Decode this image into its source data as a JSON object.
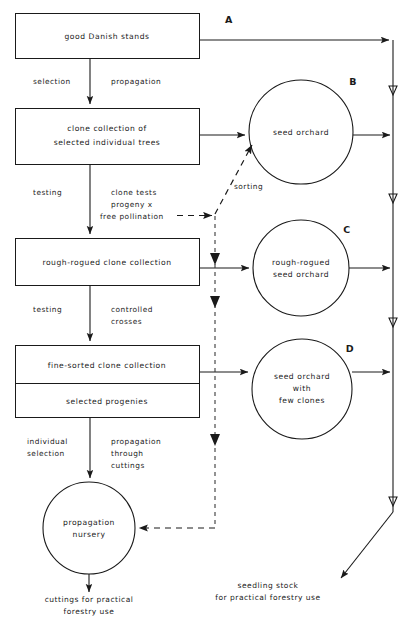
{
  "diagram": {
    "colors": {
      "stroke": "#1a1a1a",
      "background": "#ffffff",
      "dashed": "#3a3a3a"
    },
    "boxes": [
      {
        "id": "good-danish-stands",
        "lines": [
          "good Danish stands"
        ]
      },
      {
        "id": "clone-collection",
        "lines": [
          "clone collection of",
          "selected individual trees"
        ]
      },
      {
        "id": "rough-rogued-clone-collection",
        "lines": [
          "rough-rogued clone collection"
        ]
      },
      {
        "id": "fine-sorted-clone-collection",
        "lines": [
          "fine-sorted clone collection"
        ]
      },
      {
        "id": "selected-progenies",
        "lines": [
          "selected progenies"
        ]
      }
    ],
    "circles": [
      {
        "id": "seed-orchard",
        "letter": "B",
        "lines": [
          "seed orchard"
        ]
      },
      {
        "id": "rough-rogued-seed-orchard",
        "letter": "C",
        "lines": [
          "rough-rogued",
          "seed orchard"
        ]
      },
      {
        "id": "seed-orchard-few-clones",
        "letter": "D",
        "lines": [
          "seed orchard",
          "with",
          "few clones"
        ]
      },
      {
        "id": "propagation-nursery",
        "letter": "",
        "lines": [
          "propagation",
          "nursery"
        ]
      }
    ],
    "branch_letters": [
      "A",
      "B",
      "C",
      "D"
    ],
    "edge_labels": {
      "selection": "selection",
      "propagation": "propagation",
      "testing_1": "testing",
      "clone_tests": [
        "clone tests",
        "progeny x",
        "free pollination"
      ],
      "testing_2": "testing",
      "controlled_crosses": [
        "controlled",
        "crosses"
      ],
      "individual_selection": [
        "individual",
        "selection"
      ],
      "propagation_cuttings": [
        "propagation",
        "through",
        "cuttings"
      ],
      "sorting": "sorting"
    },
    "outputs": [
      {
        "id": "cuttings-output",
        "lines": [
          "cuttings for practical",
          "forestry use"
        ]
      },
      {
        "id": "seedling-stock-output",
        "lines": [
          "seedling stock",
          "for practical forestry use"
        ]
      }
    ]
  }
}
